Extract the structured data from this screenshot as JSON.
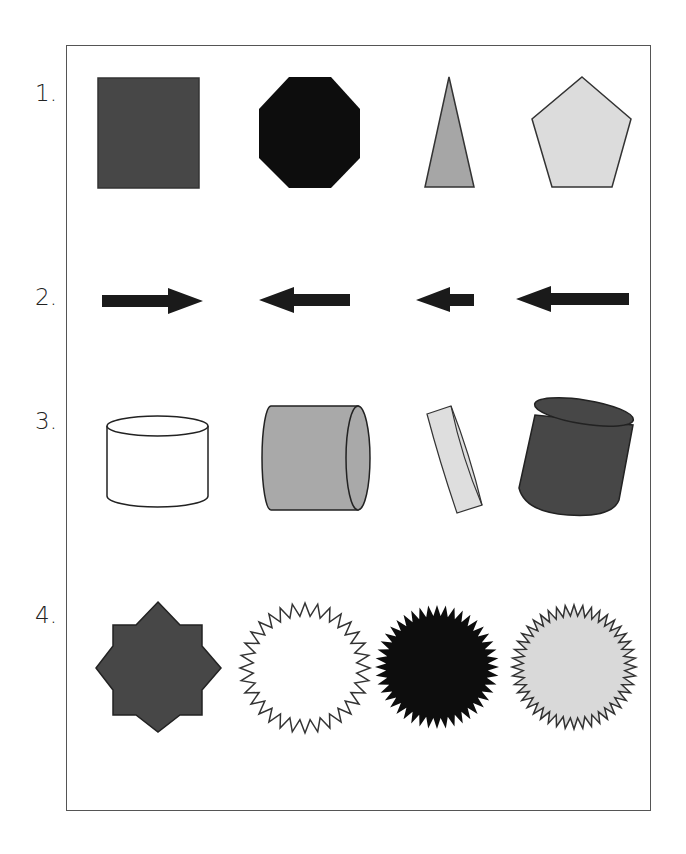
{
  "rows": [
    {
      "label": "1.",
      "shapes": [
        {
          "name": "square",
          "fill": "#474747"
        },
        {
          "name": "octagon",
          "fill": "#0d0d0d"
        },
        {
          "name": "triangle",
          "fill": "#a6a6a6"
        },
        {
          "name": "pentagon",
          "fill": "#dcdcdc"
        }
      ]
    },
    {
      "label": "2.",
      "shapes": [
        {
          "name": "arrow-right",
          "fill": "#1a1a1a"
        },
        {
          "name": "arrow-left",
          "fill": "#1a1a1a"
        },
        {
          "name": "arrow-left-short",
          "fill": "#1a1a1a"
        },
        {
          "name": "arrow-left-long",
          "fill": "#1a1a1a"
        }
      ]
    },
    {
      "label": "3.",
      "shapes": [
        {
          "name": "cylinder-upright",
          "fill": "#ffffff"
        },
        {
          "name": "cylinder-horizontal",
          "fill": "#a9a9a9"
        },
        {
          "name": "disc-tilted",
          "fill": "#dedede"
        },
        {
          "name": "cylinder-tilted",
          "fill": "#474747"
        }
      ]
    },
    {
      "label": "4.",
      "shapes": [
        {
          "name": "eight-point-star",
          "fill": "#474747"
        },
        {
          "name": "zigzag-circle",
          "fill": "#ffffff"
        },
        {
          "name": "starburst-black",
          "fill": "#0d0d0d"
        },
        {
          "name": "starburst-light",
          "fill": "#d9d9d9"
        }
      ]
    }
  ],
  "colors": {
    "frame": "#555555",
    "stroke": "#333333"
  }
}
